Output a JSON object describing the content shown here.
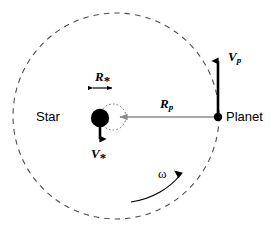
{
  "diagram": {
    "colors": {
      "stroke": "#000000",
      "background": "#ffffff",
      "orbit_dash": "#555555",
      "radius_arrow": "#808080",
      "star_fill": "#000000",
      "planet_fill": "#000000"
    },
    "labels": {
      "star": "Star",
      "planet": "Planet",
      "star_radius_symbol": "R",
      "star_radius_subscript": "*",
      "planet_radius_symbol": "R",
      "planet_radius_subscript": "p",
      "star_velocity_symbol": "V",
      "star_velocity_subscript": "*",
      "planet_velocity_symbol": "V",
      "planet_velocity_subscript": "p",
      "angular_velocity": "ω"
    },
    "geometry": {
      "orbit_center_x": 116,
      "orbit_center_y": 116,
      "orbit_radius": 103,
      "star_center_x": 100,
      "star_center_y": 118,
      "star_radius": 9,
      "star_wobble_circle_center_x": 113,
      "star_wobble_circle_center_y": 117,
      "star_wobble_circle_radius": 13,
      "planet_center_x": 218,
      "planet_center_y": 117,
      "planet_radius": 4
    }
  }
}
